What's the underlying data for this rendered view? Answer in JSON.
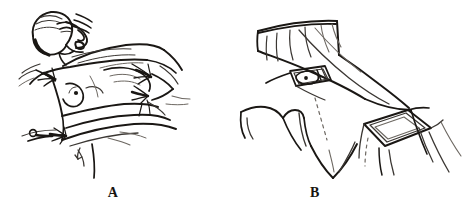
{
  "figure": {
    "kind": "line-drawing",
    "background_color": "#ffffff",
    "ink_color": "#1a1714",
    "ink_color_mid": "#3b3733",
    "ink_color_light": "#6d6862",
    "panels": [
      {
        "id": "a",
        "label": "A",
        "caption_position": "below-center",
        "description": "Patient lying supine with head turned, wearing a surgical cap; chest exposed with drapes placed around the operative field and secured with towel clips",
        "elements": [
          {
            "name": "patient-head",
            "detail": "head in profile turned to the side, eyes closed, mouth open"
          },
          {
            "name": "surgical-cap",
            "detail": "close-fitting cap covering hair"
          },
          {
            "name": "chest-torso",
            "detail": "exposed chest and breast with nipple marked"
          },
          {
            "name": "nipple-marker",
            "detail": "small solid dot"
          },
          {
            "name": "drape-sheet-upper",
            "detail": "folded drape across upper chest and shoulder"
          },
          {
            "name": "drape-sheet-lower",
            "detail": "drape across abdomen"
          },
          {
            "name": "towel-clip",
            "detail": "clips at drape corners",
            "count": 4
          },
          {
            "name": "arm-board",
            "detail": "arm extended to the side under drape"
          }
        ]
      },
      {
        "id": "b",
        "label": "B",
        "caption_position": "below-center",
        "description": "Completed drape viewed from the side showing the fenestrated openings over the operative sites",
        "elements": [
          {
            "name": "drape-sheet",
            "detail": "large sheet covering body with vertical fold lines"
          },
          {
            "name": "fenestration-chest",
            "detail": "small rectangular opening exposing nipple area with dot"
          },
          {
            "name": "fenestration-axilla",
            "detail": "larger rectangular opening over the axilla and arm"
          },
          {
            "name": "drape-fold",
            "detail": "hanging folds and creases along the sheet"
          },
          {
            "name": "drape-edge-dashed",
            "detail": "dashed line indicating hidden drape edge"
          }
        ]
      }
    ]
  }
}
